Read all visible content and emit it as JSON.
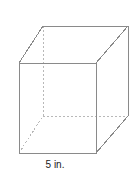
{
  "figure": {
    "name": "cube-diagram",
    "label": "A",
    "dimension_label": "5 in.",
    "shape_type": "cube",
    "edge_length_text": "5 in.",
    "unit": "in.",
    "edge_length_value": 5,
    "colors": {
      "visible_edge": "#8a8a8a",
      "hidden_edge": "#b8b8b8",
      "text": "#1a1a1a",
      "background": "#ffffff"
    },
    "geometry": {
      "front_top_left": [
        19,
        63
      ],
      "front_top_right": [
        96,
        63
      ],
      "front_bottom_right": [
        96,
        153
      ],
      "front_bottom_left": [
        19,
        153
      ],
      "back_top_left": [
        43,
        26
      ],
      "back_top_right": [
        128,
        26
      ],
      "back_bottom_right": [
        128,
        116
      ],
      "back_bottom_left": [
        43,
        116
      ]
    },
    "edges": {
      "front_face": "19,63 96,63 96,153 19,153 19,63",
      "back_top_edge": "43,26 128,26",
      "back_right_vertical": "128,26 128,116",
      "connector_top_left": "19,63 43,26",
      "connector_top_right": "96,63 128,26",
      "connector_bottom_right": "96,153 128,116",
      "hidden_back_left_vertical": "43,26 43,116",
      "hidden_back_bottom_edge": "43,116 128,116",
      "hidden_connector_bottom_left": "19,153 43,116"
    }
  }
}
